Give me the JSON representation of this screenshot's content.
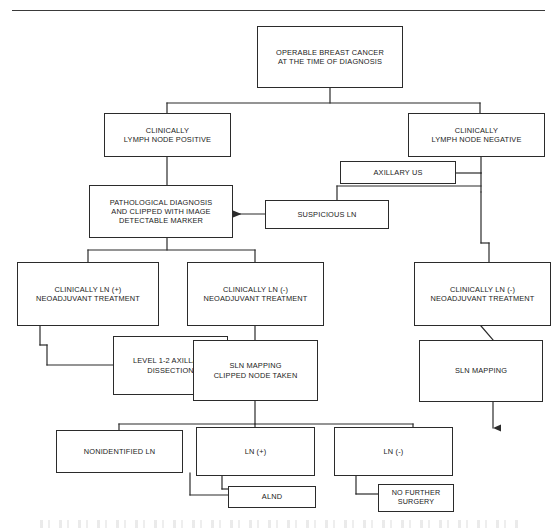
{
  "document": {
    "title": "Operable Breast Cancer Axillary Management Algorithm",
    "type": "flowchart",
    "has_top_rule": true
  },
  "style": {
    "box_border_color": "#2b2b2b",
    "line_color": "#2b2b2b",
    "text_color": "#1a1a1a",
    "background": "#ffffff"
  },
  "nodes": {
    "root": {
      "id": "operable-breast-cancer",
      "line1": "OPERABLE BREAST CANCER",
      "line2": "AT THE TIME OF DIAGNOSIS"
    },
    "ln_positive": {
      "id": "clinically-lymph-node-positive",
      "line1": "CLINICALLY",
      "line2": "LYMPH NODE POSITIVE"
    },
    "ln_negative": {
      "id": "clinically-lymph-node-negative",
      "line1": "CLINICALLY",
      "line2": "LYMPH NODE NEGATIVE"
    },
    "axillary_us": {
      "id": "axillary-us",
      "line1": "AXILLARY US"
    },
    "suspicious_ln": {
      "id": "suspicious-ln",
      "line1": "SUSPICIOUS LN"
    },
    "pathological_diagnosis": {
      "id": "pathological-diagnosis",
      "line1": "PATHOLOGICAL DIAGNOSIS",
      "line2": "AND CLIPPED WITH IMAGE",
      "line3": "DETECTABLE MARKER"
    },
    "neoadjuvant_pos": {
      "id": "clinically-ln-positive-neoadjuvant",
      "line1": "CLINICALLY LN (+)",
      "line2": "NEOADJUVANT TREATMENT"
    },
    "neoadjuvant_neg_mid": {
      "id": "clinically-ln-negative-neoadjuvant-mid",
      "line1": "CLINICALLY LN (-)",
      "line2": "NEOADJUVANT TREATMENT"
    },
    "neoadjuvant_neg_right": {
      "id": "clinically-ln-negative-neoadjuvant-right",
      "line1": "CLINICALLY LN (-)",
      "line2": "NEOADJUVANT TREATMENT"
    },
    "axillary_dissection": {
      "id": "level-1-2-axillary-dissection",
      "line1": "LEVEL 1-2 AXILLARY",
      "line2": "DISSECTION"
    },
    "sln_mapping_clipped": {
      "id": "sln-mapping-clipped-node-taken",
      "line1": "SLN MAPPING",
      "line2": "CLIPPED NODE TAKEN"
    },
    "sln_mapping": {
      "id": "sln-mapping",
      "line1": "SLN MAPPING"
    },
    "nonidentified_ln": {
      "id": "nonidentified-ln",
      "line1": "NONIDENTIFIED LN"
    },
    "ln_pos_result": {
      "id": "ln-positive-result",
      "line1": "LN (+)"
    },
    "ln_neg_result": {
      "id": "ln-negative-result",
      "line1": "LN (-)"
    },
    "alnd": {
      "id": "alnd",
      "line1": "ALND"
    },
    "no_further_surgery": {
      "id": "no-further-surgery",
      "line1": "NO FURTHER",
      "line2": "SURGERY"
    }
  },
  "edges": [
    {
      "from": "operable-breast-cancer",
      "to": "clinically-lymph-node-positive",
      "style": "elbow"
    },
    {
      "from": "operable-breast-cancer",
      "to": "clinically-lymph-node-negative",
      "style": "elbow"
    },
    {
      "from": "clinically-lymph-node-positive",
      "to": "pathological-diagnosis",
      "style": "straight"
    },
    {
      "from": "clinically-lymph-node-negative",
      "to": "axillary-us",
      "style": "elbow"
    },
    {
      "from": "axillary-us",
      "to": "suspicious-ln",
      "style": "elbow"
    },
    {
      "from": "suspicious-ln",
      "to": "pathological-diagnosis",
      "style": "arrow-left"
    },
    {
      "from": "pathological-diagnosis",
      "to": "clinically-ln-positive-neoadjuvant",
      "style": "elbow"
    },
    {
      "from": "pathological-diagnosis",
      "to": "clinically-ln-negative-neoadjuvant-mid",
      "style": "elbow"
    },
    {
      "from": "clinically-lymph-node-negative",
      "to": "clinically-ln-negative-neoadjuvant-right",
      "style": "elbow"
    },
    {
      "from": "clinically-ln-positive-neoadjuvant",
      "to": "level-1-2-axillary-dissection",
      "style": "elbow"
    },
    {
      "from": "clinically-ln-negative-neoadjuvant-mid",
      "to": "sln-mapping-clipped-node-taken",
      "style": "straight"
    },
    {
      "from": "clinically-ln-negative-neoadjuvant-right",
      "to": "sln-mapping",
      "style": "diagonal"
    },
    {
      "from": "sln-mapping-clipped-node-taken",
      "to": "nonidentified-ln",
      "style": "elbow"
    },
    {
      "from": "sln-mapping-clipped-node-taken",
      "to": "ln-positive-result",
      "style": "straight"
    },
    {
      "from": "sln-mapping-clipped-node-taken",
      "to": "ln-negative-result",
      "style": "elbow"
    },
    {
      "from": "sln-mapping",
      "to": "ln-negative-result",
      "style": "arrow-down"
    },
    {
      "from": "nonidentified-ln",
      "to": "alnd",
      "style": "elbow"
    },
    {
      "from": "ln-positive-result",
      "to": "alnd",
      "style": "elbow"
    },
    {
      "from": "ln-negative-result",
      "to": "no-further-surgery",
      "style": "elbow"
    }
  ]
}
